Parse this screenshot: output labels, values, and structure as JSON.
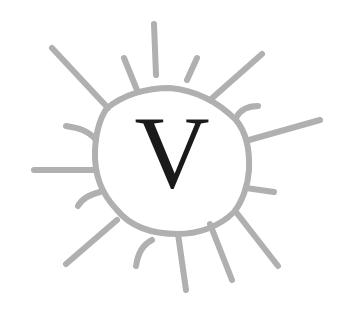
{
  "logo": {
    "letter": "V",
    "ring_color": "#b0b0b0",
    "letter_color": "#1a1a1a",
    "background": "#ffffff"
  }
}
